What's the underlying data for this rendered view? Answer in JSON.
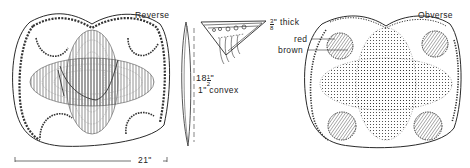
{
  "figure": {
    "views": {
      "reverse": {
        "label": "Reverse"
      },
      "obverse": {
        "label": "Obverse"
      }
    },
    "dimensions": {
      "width": "21\"",
      "height_fraction_whole": "18",
      "height_fraction_num": "1",
      "height_fraction_den": "2",
      "height_unit": "\"",
      "convexity": "1\" convex",
      "thickness_num": "3",
      "thickness_den": "8",
      "thickness_text": "\" thick"
    },
    "color_callouts": {
      "red": "red",
      "brown": "brown"
    },
    "colors": {
      "ink": "#2a2a2a",
      "background": "#ffffff"
    }
  }
}
